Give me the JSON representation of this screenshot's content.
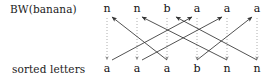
{
  "figure": {
    "type": "diagram",
    "labels": {
      "top_row": "BW(banana)",
      "bottom_row": "sorted letters"
    },
    "colors": {
      "text": "#111111",
      "line": "#333333",
      "dotted": "#999999",
      "background": "#ffffff"
    },
    "columns": {
      "count": 6,
      "x": [
        107,
        137,
        167,
        197,
        227,
        257
      ],
      "top_y": 12,
      "bottom_y": 66
    },
    "top_letters": [
      {
        "index": 0,
        "char": "n",
        "x": 107
      },
      {
        "index": 1,
        "char": "n",
        "x": 137
      },
      {
        "index": 2,
        "char": "b",
        "x": 167
      },
      {
        "index": 3,
        "char": "a",
        "x": 197
      },
      {
        "index": 4,
        "char": "a",
        "x": 227
      },
      {
        "index": 5,
        "char": "a",
        "x": 257
      }
    ],
    "bottom_letters": [
      {
        "index": 0,
        "char": "a",
        "x": 107
      },
      {
        "index": 1,
        "char": "a",
        "x": 137
      },
      {
        "index": 2,
        "char": "a",
        "x": 167
      },
      {
        "index": 3,
        "char": "b",
        "x": 197
      },
      {
        "index": 4,
        "char": "n",
        "x": 227
      },
      {
        "index": 5,
        "char": "n",
        "x": 257
      }
    ],
    "dotted_verticals": [
      {
        "x": 107,
        "from_y": 18,
        "to_y": 60,
        "arrow": "down"
      },
      {
        "x": 137,
        "from_y": 18,
        "to_y": 60,
        "arrow": "down"
      },
      {
        "x": 167,
        "from_y": 18,
        "to_y": 60,
        "arrow": "down"
      },
      {
        "x": 197,
        "from_y": 18,
        "to_y": 60,
        "arrow": "down"
      },
      {
        "x": 227,
        "from_y": 18,
        "to_y": 60,
        "arrow": "down"
      },
      {
        "x": 257,
        "from_y": 18,
        "to_y": 60,
        "arrow": "down"
      }
    ],
    "solid_arrows": [
      {
        "from_index": 2,
        "to_index": 0,
        "from_x": 167,
        "from_y": 60,
        "to_x": 112,
        "to_y": 17,
        "arrow": "up-left"
      },
      {
        "from_index": 4,
        "to_index": 1,
        "from_x": 227,
        "from_y": 60,
        "to_x": 142,
        "to_y": 17,
        "arrow": "up-left"
      },
      {
        "from_index": 5,
        "to_index": 3,
        "from_x": 257,
        "from_y": 60,
        "to_x": 176,
        "to_y": 17,
        "arrow": "up-left"
      },
      {
        "from_index": 0,
        "to_index": 3,
        "from_x": 112,
        "from_y": 60,
        "to_x": 192,
        "to_y": 17,
        "arrow": "up-right"
      },
      {
        "from_index": 1,
        "to_index": 4,
        "from_x": 142,
        "from_y": 60,
        "to_x": 222,
        "to_y": 17,
        "arrow": "up-right"
      },
      {
        "from_index": 3,
        "to_index": 5,
        "from_x": 197,
        "from_y": 60,
        "to_x": 252,
        "to_y": 17,
        "arrow": "up-right"
      }
    ]
  }
}
